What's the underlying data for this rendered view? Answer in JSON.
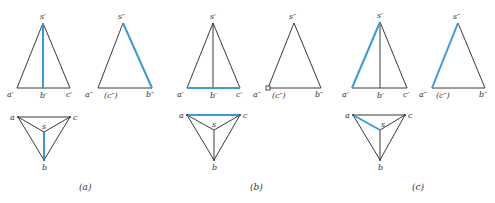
{
  "colors": {
    "line": "#3a3a3a",
    "highlight": "#3a9ad9",
    "text": "#333333",
    "background": "#ffffff"
  },
  "panels": [
    {
      "caption": "(a)",
      "highlighted_edge": "sb",
      "front_view": {
        "labels": {
          "s": "s′",
          "a": "a′",
          "b": "b′",
          "c": "c′"
        }
      },
      "side_view": {
        "labels": {
          "s": "s″",
          "a": "a″",
          "c": "(c″)",
          "b": "b″"
        }
      },
      "top_view": {
        "labels": {
          "a": "a",
          "c": "c",
          "s": "s",
          "b": "b"
        }
      }
    },
    {
      "caption": "(b)",
      "highlighted_edge": "ac",
      "front_view": {
        "labels": {
          "s": "s′",
          "a": "a′",
          "b": "b′",
          "c": "c′"
        }
      },
      "side_view": {
        "labels": {
          "s": "s″",
          "a": "a″",
          "c": "(c″)",
          "b": "b″"
        }
      },
      "top_view": {
        "labels": {
          "a": "a",
          "c": "c",
          "s": "s",
          "b": "b"
        }
      }
    },
    {
      "caption": "(c)",
      "highlighted_edge": "sa",
      "front_view": {
        "labels": {
          "s": "s′",
          "a": "a′",
          "b": "b′",
          "c": "c′"
        }
      },
      "side_view": {
        "labels": {
          "s": "s″",
          "a": "a″",
          "c": "(c″)",
          "b": "b″"
        }
      },
      "top_view": {
        "labels": {
          "a": "a",
          "c": "c",
          "s": "s",
          "b": "b"
        }
      }
    }
  ]
}
